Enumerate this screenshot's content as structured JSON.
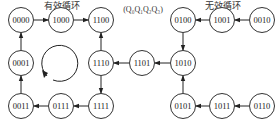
{
  "titles": {
    "valid_cycle": "有效循环",
    "invalid_cycle": "无效循环",
    "state_order": "(Q₀Q₁Q₂Q₃)"
  },
  "nodes": [
    {
      "id": "n0000",
      "label": "0000",
      "x": 21,
      "y": 20
    },
    {
      "id": "n1000",
      "label": "1000",
      "x": 61,
      "y": 20
    },
    {
      "id": "n1100",
      "label": "1100",
      "x": 101,
      "y": 20
    },
    {
      "id": "n0001",
      "label": "0001",
      "x": 21,
      "y": 63
    },
    {
      "id": "n1110",
      "label": "1110",
      "x": 101,
      "y": 63
    },
    {
      "id": "n0011",
      "label": "0011",
      "x": 21,
      "y": 106
    },
    {
      "id": "n0111",
      "label": "0111",
      "x": 61,
      "y": 106
    },
    {
      "id": "n1111",
      "label": "1111",
      "x": 101,
      "y": 106
    },
    {
      "id": "n1101",
      "label": "1101",
      "x": 142,
      "y": 63
    },
    {
      "id": "n1010",
      "label": "1010",
      "x": 183,
      "y": 63
    },
    {
      "id": "n0100",
      "label": "0100",
      "x": 183,
      "y": 20
    },
    {
      "id": "n1001",
      "label": "1001",
      "x": 222,
      "y": 20
    },
    {
      "id": "n0010",
      "label": "0010",
      "x": 262,
      "y": 20
    },
    {
      "id": "n0101",
      "label": "0101",
      "x": 183,
      "y": 106
    },
    {
      "id": "n1011",
      "label": "1011",
      "x": 222,
      "y": 106
    },
    {
      "id": "n0110",
      "label": "0110",
      "x": 262,
      "y": 106
    }
  ],
  "edges": [
    {
      "from": "0000",
      "to": "1000"
    },
    {
      "from": "1000",
      "to": "1100"
    },
    {
      "from": "1110",
      "to": "1100"
    },
    {
      "from": "1110",
      "to": "1111"
    },
    {
      "from": "1111",
      "to": "0111"
    },
    {
      "from": "0111",
      "to": "0011"
    },
    {
      "from": "0011",
      "to": "0001"
    },
    {
      "from": "0001",
      "to": "0000"
    },
    {
      "from": "1101",
      "to": "1110"
    },
    {
      "from": "1010",
      "to": "1101"
    },
    {
      "from": "0100",
      "to": "1010"
    },
    {
      "from": "1001",
      "to": "0100"
    },
    {
      "from": "0010",
      "to": "1001"
    },
    {
      "from": "0101",
      "to": "1010"
    },
    {
      "from": "1011",
      "to": "0101"
    },
    {
      "from": "0110",
      "to": "1011"
    }
  ],
  "colors": {
    "stroke": "#333333",
    "text": "#222222",
    "background": "#ffffff"
  }
}
